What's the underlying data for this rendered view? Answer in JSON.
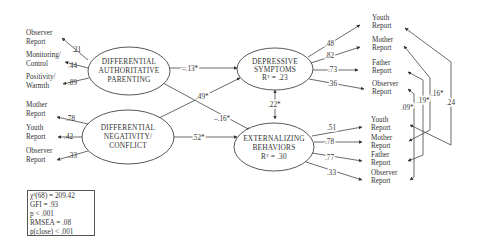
{
  "latent": {
    "dap": [
      "DIFFERENTIAL",
      "AUTHORITATIVE",
      "PARENTING"
    ],
    "dnc": [
      "DIFFERENTIAL",
      "NEGATIVITY/",
      "CONFLICT"
    ],
    "dep": [
      "DEPRESSIVE",
      "SYMPTOMS",
      "R² = .23"
    ],
    "ext": [
      "EXTERNALIZING",
      "BEHAVIORS",
      "R² = .30"
    ]
  },
  "indicators": {
    "dap": [
      {
        "label": [
          "Observer",
          "Report"
        ],
        "loading": ".21"
      },
      {
        "label": [
          "Monitoring/",
          "Control"
        ],
        "loading": ".44"
      },
      {
        "label": [
          "Positivity/",
          "Warmth"
        ],
        "loading": ".89"
      }
    ],
    "dnc": [
      {
        "label": [
          "Mother",
          "Report"
        ],
        "loading": ".78"
      },
      {
        "label": [
          "Youth",
          "Report"
        ],
        "loading": ".42"
      },
      {
        "label": [
          "Observer",
          "Report"
        ],
        "loading": ".33"
      }
    ],
    "dep": [
      {
        "label": [
          "Youth",
          "Report"
        ],
        "loading": ".48"
      },
      {
        "label": [
          "Mother",
          "Report"
        ],
        "loading": ".82"
      },
      {
        "label": [
          "Father",
          "Report"
        ],
        "loading": ".73"
      },
      {
        "label": [
          "Observer",
          "Report"
        ],
        "loading": ".36"
      }
    ],
    "ext": [
      {
        "label": [
          "Youth",
          "Report"
        ],
        "loading": ".51"
      },
      {
        "label": [
          "Mother",
          "Report"
        ],
        "loading": ".78"
      },
      {
        "label": [
          "Father",
          "Report"
        ],
        "loading": ".77"
      },
      {
        "label": [
          "Observer",
          "Report"
        ],
        "loading": ".33"
      }
    ]
  },
  "paths": {
    "dap_to_dep": "–.13*",
    "dap_to_ext": "–.16*",
    "dnc_to_dep": ".49*",
    "dnc_to_ext": ".52*",
    "dep_ext_cov": ".22*"
  },
  "error_covariances": {
    "youth": ".24",
    "mother": ".16*",
    "father": ".19*",
    "observer": ".09*"
  },
  "fit": [
    "χ²(68) = 209.42",
    "GFI = .93",
    "p < .001",
    "RMSEA = .08",
    "p(close) < .001"
  ]
}
